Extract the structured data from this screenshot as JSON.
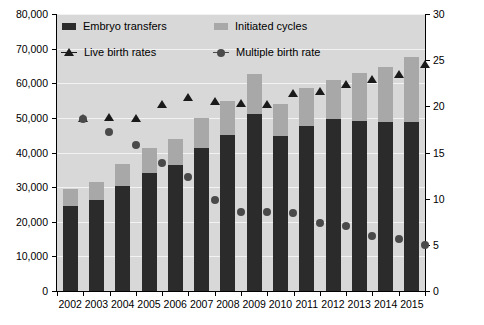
{
  "chart_data": {
    "type": "bar",
    "title": "",
    "subtitle": "",
    "xlabel": "",
    "ylabel": "",
    "ylabel_right": "",
    "grid": true,
    "legend_position": "top-left-inside",
    "categories": [
      "2002",
      "2003",
      "2004",
      "2005",
      "2006",
      "2007",
      "2008",
      "2009",
      "2010",
      "2011",
      "2012",
      "2013",
      "2014",
      "2015"
    ],
    "ylim": [
      0,
      80000
    ],
    "yticks": [
      "0",
      "10,000",
      "20,000",
      "30,000",
      "40,000",
      "50,000",
      "60,000",
      "70,000",
      "80,000"
    ],
    "ylim_right": [
      0,
      30
    ],
    "yticks_right": [
      "0",
      "5",
      "10",
      "15",
      "20",
      "25",
      "30"
    ],
    "series": [
      {
        "name": "Initiated cycles",
        "axis": "left",
        "kind": "bar-total",
        "color": "#a8a8a8",
        "values": [
          29400,
          31500,
          36700,
          41300,
          43800,
          50000,
          54900,
          62800,
          54100,
          58600,
          61000,
          62900,
          64600,
          67500
        ]
      },
      {
        "name": "Embryo transfers",
        "axis": "left",
        "kind": "bar-segment",
        "color": "#2b2b2b",
        "values": [
          24500,
          26200,
          30300,
          34100,
          36400,
          41400,
          45000,
          51000,
          44900,
          47800,
          49700,
          49200,
          48800,
          48800
        ]
      },
      {
        "name": "Live birth rates",
        "axis": "right",
        "kind": "marker-triangle",
        "color": "#1a1a1a",
        "values": [
          18.7,
          18.8,
          18.7,
          20.2,
          21.0,
          20.6,
          20.4,
          20.3,
          21.4,
          21.7,
          22.4,
          23.0,
          23.5,
          24.6
        ]
      },
      {
        "name": "Multiple birth rate",
        "axis": "right",
        "kind": "marker-circle",
        "color": "#4a4a4a",
        "values": [
          18.6,
          17.2,
          15.8,
          13.9,
          12.4,
          9.9,
          8.6,
          8.6,
          8.5,
          7.4,
          7.0,
          6.0,
          5.6,
          5.0
        ]
      }
    ]
  },
  "legend": {
    "items": [
      {
        "label": "Embryo transfers",
        "icon": "black-square-swatch"
      },
      {
        "label": "Initiated cycles",
        "icon": "gray-square-swatch"
      },
      {
        "label": "Live birth rates",
        "icon": "triangle-marker"
      },
      {
        "label": "Multiple birth rate",
        "icon": "circle-marker"
      }
    ]
  },
  "colors": {
    "plot_background": "#d8d8d8",
    "gridline": "#f2f2f2",
    "bar_dark": "#2b2b2b",
    "bar_light": "#a8a8a8",
    "triangle": "#1a1a1a",
    "circle": "#4a4a4a",
    "axis": "#000000",
    "page_background": "#ffffff"
  }
}
